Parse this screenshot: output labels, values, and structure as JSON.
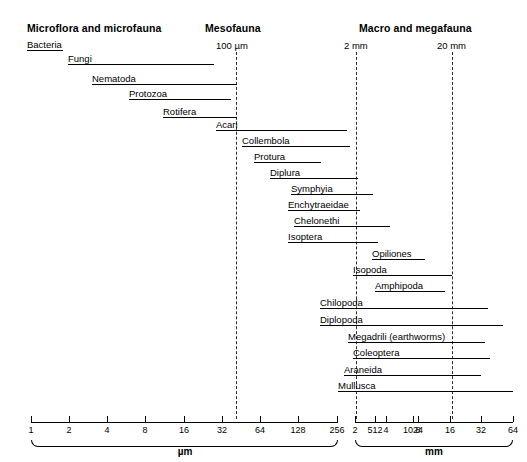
{
  "figure": {
    "type": "range-chart",
    "group_headers": [
      {
        "label": "Microflora and microfauna",
        "x": 27,
        "y": 22
      },
      {
        "label": "Mesofauna",
        "x": 205,
        "y": 22
      },
      {
        "label": "Macro and megafauna",
        "x": 359,
        "y": 22
      }
    ],
    "boundary_markers": [
      {
        "label": "100 µm",
        "x": 216,
        "y": 40,
        "line_x": 236
      },
      {
        "label": "2 mm",
        "x": 344,
        "y": 40,
        "line_x": 356
      },
      {
        "label": "20 mm",
        "x": 437,
        "y": 40,
        "line_x": 452
      }
    ],
    "boundary_line_top": 52,
    "boundary_line_bottom": 419,
    "taxa": [
      {
        "name": "Bacteria",
        "label_x": 27,
        "y": 50,
        "line_x": 27,
        "line_w": 36
      },
      {
        "name": "Fungi",
        "label_x": 68,
        "y": 64,
        "line_x": 68,
        "line_w": 146
      },
      {
        "name": "Nematoda",
        "label_x": 92,
        "y": 84,
        "line_x": 92,
        "line_w": 145
      },
      {
        "name": "Protozoa",
        "label_x": 129,
        "y": 99,
        "line_x": 129,
        "line_w": 102
      },
      {
        "name": "Rotifera",
        "label_x": 163,
        "y": 117,
        "line_x": 163,
        "line_w": 74
      },
      {
        "name": "Acari",
        "label_x": 216,
        "y": 130,
        "line_x": 216,
        "line_w": 131
      },
      {
        "name": "Collembola",
        "label_x": 242,
        "y": 146,
        "line_x": 242,
        "line_w": 108
      },
      {
        "name": "Protura",
        "label_x": 254,
        "y": 162,
        "line_x": 254,
        "line_w": 67
      },
      {
        "name": "Diplura",
        "label_x": 270,
        "y": 178,
        "line_x": 270,
        "line_w": 88
      },
      {
        "name": "Symphyia",
        "label_x": 291,
        "y": 194,
        "line_x": 291,
        "line_w": 82
      },
      {
        "name": "Enchytraeidae",
        "label_x": 288,
        "y": 210,
        "line_x": 288,
        "line_w": 72
      },
      {
        "name": "Chelonethi",
        "label_x": 294,
        "y": 226,
        "line_x": 294,
        "line_w": 96
      },
      {
        "name": "Isoptera",
        "label_x": 288,
        "y": 242,
        "line_x": 288,
        "line_w": 90
      },
      {
        "name": "Opiliones",
        "label_x": 372,
        "y": 259,
        "line_x": 372,
        "line_w": 53
      },
      {
        "name": "Isopoda",
        "label_x": 353,
        "y": 275,
        "line_x": 353,
        "line_w": 99
      },
      {
        "name": "Amphipoda",
        "label_x": 375,
        "y": 291,
        "line_x": 375,
        "line_w": 70
      },
      {
        "name": "Chilopoda",
        "label_x": 320,
        "y": 308,
        "line_x": 320,
        "line_w": 168
      },
      {
        "name": "Diplopoda",
        "label_x": 320,
        "y": 325,
        "line_x": 320,
        "line_w": 183
      },
      {
        "name": "Megadrili (earthworms)",
        "label_x": 348,
        "y": 342,
        "line_x": 348,
        "line_w": 137
      },
      {
        "name": "Coleoptera",
        "label_x": 353,
        "y": 358,
        "line_x": 353,
        "line_w": 137
      },
      {
        "name": "Araneida",
        "label_x": 344,
        "y": 375,
        "line_x": 344,
        "line_w": 137
      },
      {
        "name": "Mullusca",
        "label_x": 338,
        "y": 391,
        "line_x": 338,
        "line_w": 175
      }
    ],
    "axes": [
      {
        "unit": "µm",
        "x_start": 31,
        "x_end": 338,
        "y": 422,
        "unit_label_x": 185,
        "ticks": [
          {
            "label": "1",
            "x": 31
          },
          {
            "label": "2",
            "x": 69
          },
          {
            "label": "4",
            "x": 107
          },
          {
            "label": "8",
            "x": 145
          },
          {
            "label": "16",
            "x": 184
          },
          {
            "label": "32",
            "x": 222
          },
          {
            "label": "64",
            "x": 260
          },
          {
            "label": "128",
            "x": 298
          },
          {
            "label": "256",
            "x": 337
          },
          {
            "label": "512",
            "x": 375
          },
          {
            "label": "1024",
            "x": 413
          }
        ]
      },
      {
        "unit": "mm",
        "x_start": 355,
        "x_end": 513,
        "y": 422,
        "unit_label_x": 434,
        "ticks": [
          {
            "label": "2",
            "x": 355
          },
          {
            "label": "4",
            "x": 386
          },
          {
            "label": "8",
            "x": 418
          },
          {
            "label": "16",
            "x": 450
          },
          {
            "label": "32",
            "x": 481
          },
          {
            "label": "64",
            "x": 513
          }
        ]
      }
    ],
    "axis_tick_top": 416,
    "axis_ticklabel_y": 425,
    "axis_line_y": 422,
    "braces": [
      {
        "x": 31,
        "w": 307,
        "y": 440,
        "unit": "µm",
        "label_x": 185
      },
      {
        "x": 355,
        "w": 158,
        "y": 440,
        "unit": "mm",
        "label_x": 434
      }
    ],
    "brace_label_y": 446
  }
}
